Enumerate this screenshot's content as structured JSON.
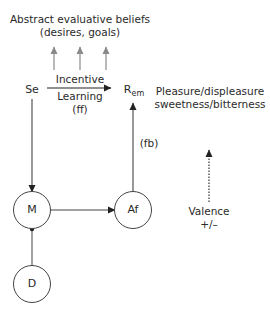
{
  "top_label": {
    "line1": "Abstract evaluative beliefs",
    "line2": "(desires, goals)"
  },
  "nodes": {
    "se": "Se",
    "r_em_base": "R",
    "r_em_sub": "em",
    "m": "M",
    "af": "Af",
    "d": "D"
  },
  "edges": {
    "incentive_line1": "Incentive",
    "incentive_line2": "Learning",
    "incentive_line3": "(ff)",
    "feedback": "(fb)"
  },
  "right_panel": {
    "line1": "Pleasure/displeasure",
    "line2": "sweetness/bitterness",
    "valence": "Valence",
    "valence_sign": "+/–"
  },
  "colors": {
    "line": "#333333",
    "gray_arrow": "#8a8a8a",
    "text": "#2a2a2a"
  }
}
